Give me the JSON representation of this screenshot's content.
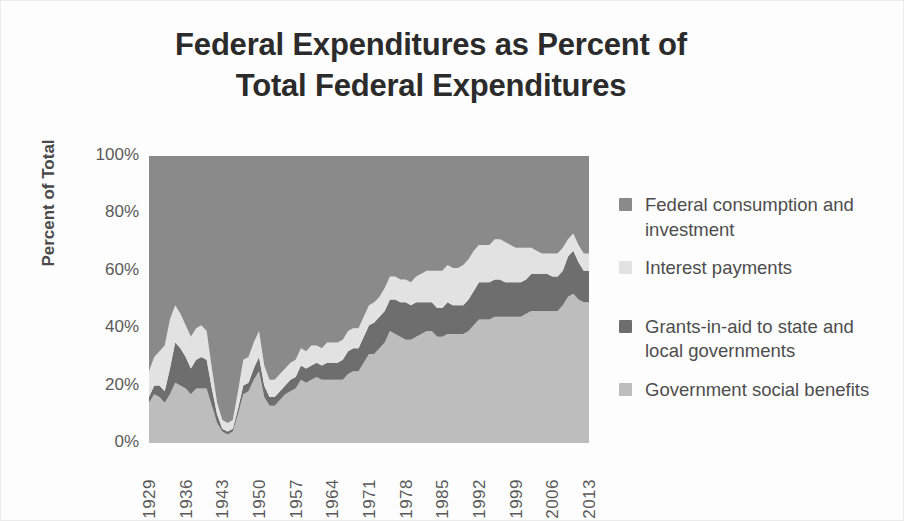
{
  "chart": {
    "title_line1": "Federal Expenditures as Percent of",
    "title_line2": "Total Federal Expenditures",
    "y_axis_title": "Percent of Total",
    "y_ticks": [
      "100%",
      "80%",
      "60%",
      "40%",
      "20%",
      "0%"
    ],
    "x_ticks": [
      "1929",
      "1936",
      "1943",
      "1950",
      "1957",
      "1964",
      "1971",
      "1978",
      "1985",
      "1992",
      "1999",
      "2006",
      "2013"
    ]
  },
  "legend": {
    "items": [
      {
        "label": "Federal consumption and investment",
        "color": "#8a8a8a",
        "swatch_name": "legend-swatch-federal-consumption"
      },
      {
        "label": "Interest payments",
        "color": "#e2e2e2",
        "swatch_name": "legend-swatch-interest-payments"
      },
      {
        "label": "Grants-in-aid to state and local governments",
        "color": "#6e6e6e",
        "swatch_name": "legend-swatch-grants-in-aid"
      },
      {
        "label": "Government social benefits",
        "color": "#bdbdbd",
        "swatch_name": "legend-swatch-social-benefits"
      }
    ]
  },
  "chart_data": {
    "type": "area",
    "stacked": true,
    "normalized": true,
    "title": "Federal Expenditures as Percent of Total Federal Expenditures",
    "xlabel": "",
    "ylabel": "Percent of Total",
    "ylim": [
      0,
      100
    ],
    "ytick_values": [
      0,
      20,
      40,
      60,
      80,
      100
    ],
    "ytick_labels": [
      "0%",
      "20%",
      "40%",
      "60%",
      "80%",
      "100%"
    ],
    "xlim": [
      1929,
      2013
    ],
    "xtick_values": [
      1929,
      1936,
      1943,
      1950,
      1957,
      1964,
      1971,
      1978,
      1985,
      1992,
      1999,
      2006,
      2013
    ],
    "grid": false,
    "legend_position": "right",
    "x": [
      1929,
      1930,
      1931,
      1932,
      1933,
      1934,
      1935,
      1936,
      1937,
      1938,
      1939,
      1940,
      1941,
      1942,
      1943,
      1944,
      1945,
      1946,
      1947,
      1948,
      1949,
      1950,
      1951,
      1952,
      1953,
      1954,
      1955,
      1956,
      1957,
      1958,
      1959,
      1960,
      1961,
      1962,
      1963,
      1964,
      1965,
      1966,
      1967,
      1968,
      1969,
      1970,
      1971,
      1972,
      1973,
      1974,
      1975,
      1976,
      1977,
      1978,
      1979,
      1980,
      1981,
      1982,
      1983,
      1984,
      1985,
      1986,
      1987,
      1988,
      1989,
      1990,
      1991,
      1992,
      1993,
      1994,
      1995,
      1996,
      1997,
      1998,
      1999,
      2000,
      2001,
      2002,
      2003,
      2004,
      2005,
      2006,
      2007,
      2008,
      2009,
      2010,
      2011,
      2012,
      2013
    ],
    "series": [
      {
        "name": "Government social benefits",
        "color": "#bdbdbd",
        "stack_order": 1,
        "values": [
          14,
          17,
          16,
          14,
          17,
          21,
          20,
          19,
          17,
          19,
          19,
          19,
          13,
          7,
          4,
          3,
          4,
          10,
          17,
          18,
          22,
          25,
          16,
          13,
          13,
          15,
          17,
          18,
          19,
          22,
          21,
          22,
          23,
          22,
          22,
          22,
          22,
          22,
          24,
          25,
          25,
          28,
          31,
          31,
          33,
          35,
          39,
          38,
          37,
          36,
          36,
          37,
          38,
          39,
          39,
          37,
          37,
          38,
          38,
          38,
          38,
          39,
          41,
          43,
          43,
          43,
          44,
          44,
          44,
          44,
          44,
          44,
          45,
          46,
          46,
          46,
          46,
          46,
          46,
          48,
          51,
          52,
          50,
          49,
          49
        ]
      },
      {
        "name": "Grants-in-aid to state and local governments",
        "color": "#6e6e6e",
        "stack_order": 2,
        "values": [
          2,
          3,
          4,
          4,
          9,
          14,
          13,
          11,
          9,
          10,
          11,
          10,
          6,
          3,
          1,
          1,
          1,
          2,
          3,
          3,
          4,
          5,
          4,
          3,
          3,
          3,
          3,
          4,
          4,
          5,
          5,
          5,
          5,
          5,
          6,
          6,
          6,
          7,
          8,
          8,
          8,
          9,
          10,
          11,
          11,
          11,
          11,
          12,
          12,
          13,
          12,
          12,
          11,
          10,
          10,
          10,
          10,
          11,
          10,
          10,
          10,
          11,
          12,
          13,
          13,
          13,
          13,
          13,
          12,
          12,
          12,
          12,
          12,
          13,
          13,
          13,
          13,
          12,
          12,
          12,
          14,
          15,
          13,
          11,
          11
        ]
      },
      {
        "name": "Interest payments",
        "color": "#e2e2e2",
        "stack_order": 3,
        "values": [
          9,
          10,
          12,
          16,
          17,
          13,
          12,
          11,
          11,
          11,
          11,
          10,
          7,
          4,
          3,
          3,
          3,
          6,
          9,
          9,
          9,
          9,
          7,
          6,
          6,
          6,
          6,
          6,
          6,
          6,
          6,
          7,
          6,
          6,
          7,
          7,
          7,
          7,
          7,
          7,
          7,
          7,
          7,
          7,
          7,
          8,
          8,
          8,
          8,
          8,
          8,
          9,
          10,
          11,
          11,
          13,
          13,
          13,
          13,
          13,
          14,
          14,
          14,
          13,
          13,
          13,
          14,
          14,
          14,
          13,
          12,
          12,
          11,
          9,
          8,
          7,
          7,
          8,
          8,
          8,
          6,
          6,
          6,
          6,
          6
        ]
      },
      {
        "name": "Federal consumption and investment",
        "color": "#8a8a8a",
        "stack_order": 4,
        "values": [
          75,
          70,
          68,
          66,
          57,
          52,
          55,
          59,
          63,
          60,
          59,
          61,
          74,
          86,
          92,
          93,
          92,
          82,
          71,
          70,
          65,
          61,
          73,
          78,
          78,
          76,
          74,
          72,
          71,
          67,
          68,
          66,
          66,
          67,
          65,
          65,
          65,
          64,
          61,
          60,
          60,
          56,
          52,
          51,
          49,
          46,
          42,
          42,
          43,
          43,
          44,
          42,
          41,
          40,
          40,
          40,
          40,
          38,
          39,
          39,
          38,
          36,
          33,
          31,
          31,
          31,
          29,
          29,
          30,
          31,
          32,
          32,
          32,
          32,
          33,
          34,
          34,
          34,
          34,
          32,
          29,
          27,
          31,
          34,
          34
        ]
      }
    ]
  }
}
